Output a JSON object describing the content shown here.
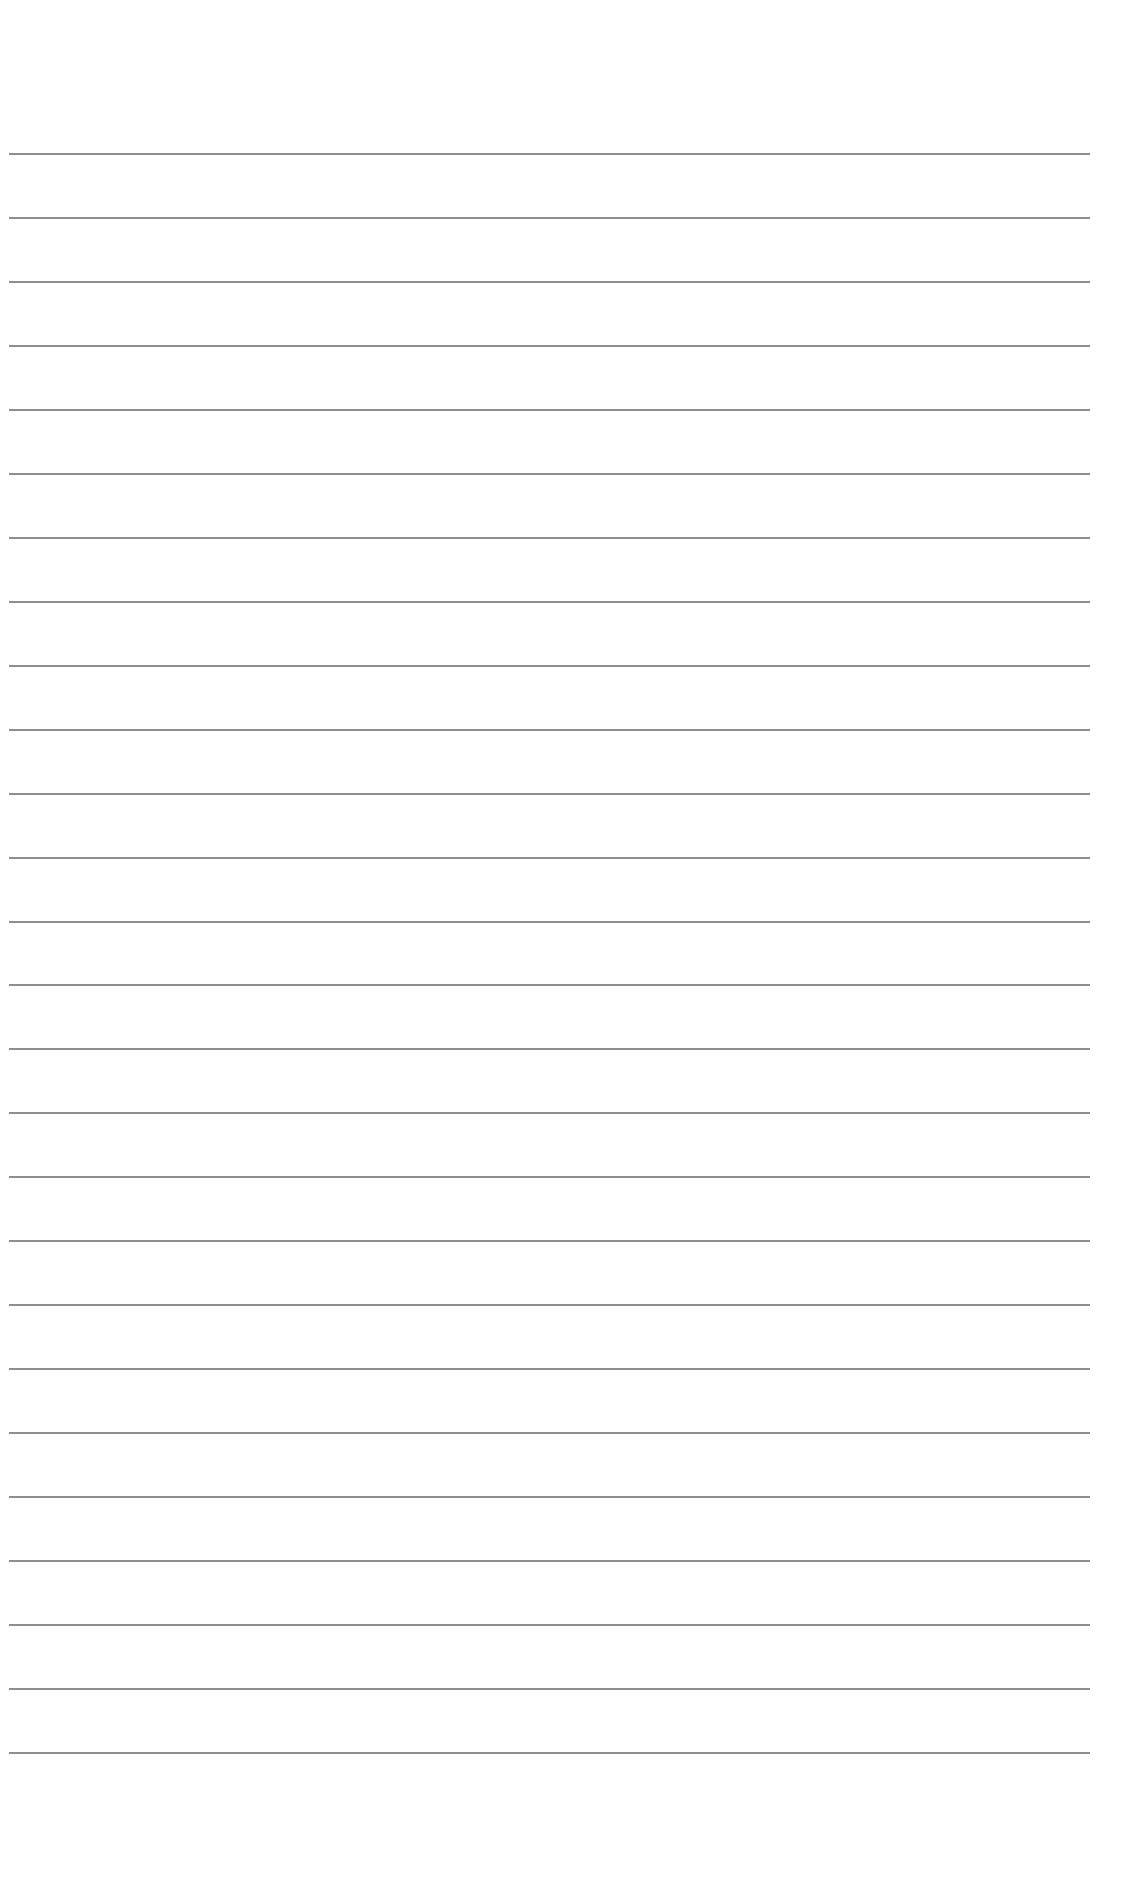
{
  "document": {
    "type": "lined-paper",
    "background_color": "#ffffff",
    "rule_color": "#7a7a7a",
    "rules": {
      "count": 26,
      "first_y": 153,
      "spacing": 63.96,
      "left_x": 9,
      "right_x": 1090
    },
    "text": []
  }
}
